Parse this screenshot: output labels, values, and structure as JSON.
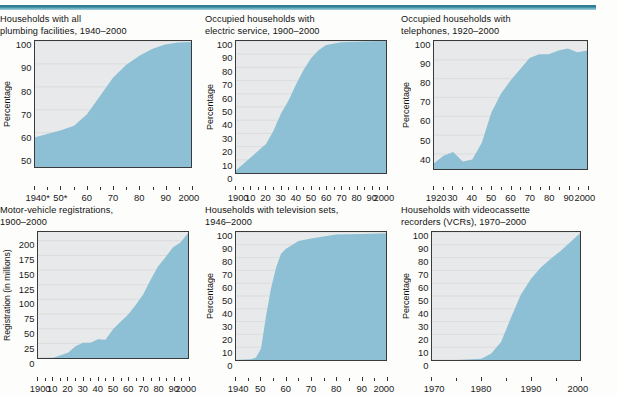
{
  "page": {
    "accent_color": "#2e7f94",
    "area_fill_color": "#8dc0d4",
    "plot_background_color": "#e8e9ea",
    "axis_color": "#3a3a3a"
  },
  "chart_data": [
    {
      "id": "plumbing",
      "type": "area",
      "title": "Households with all\nplumbing facilities, 1940–2000",
      "ylabel": "Percentage",
      "xlabel": "",
      "ylim": [
        45,
        100
      ],
      "yticks": [
        100,
        90,
        80,
        70,
        60,
        50
      ],
      "xlim": [
        1940,
        2000
      ],
      "xtick_values": [
        1940,
        1950,
        1960,
        1970,
        1980,
        1990,
        2000
      ],
      "xtick_labels": [
        "1940*",
        "50*",
        "60",
        "70",
        "80",
        "90",
        "2000"
      ],
      "grid": true,
      "x": [
        1940,
        1945,
        1950,
        1955,
        1960,
        1965,
        1970,
        1975,
        1980,
        1985,
        1990,
        1995,
        2000
      ],
      "values": [
        58,
        59.5,
        61,
        63,
        68,
        76,
        84,
        89.5,
        93.5,
        96.5,
        98.5,
        99.3,
        99.6
      ]
    },
    {
      "id": "electric-service",
      "type": "area",
      "title": "Occupied households with\nelectric service, 1900–2000",
      "ylabel": "Percentage",
      "xlabel": "",
      "ylim": [
        0,
        100
      ],
      "yticks": [
        100,
        90,
        80,
        70,
        60,
        50,
        40,
        30,
        20,
        10,
        0
      ],
      "xlim": [
        1900,
        2000
      ],
      "xtick_values": [
        1900,
        1910,
        1920,
        1930,
        1940,
        1950,
        1960,
        1970,
        1980,
        1990,
        2000
      ],
      "xtick_labels": [
        "1900",
        "10",
        "20",
        "30",
        "40",
        "50",
        "60",
        "70",
        "80",
        "90",
        "2000"
      ],
      "grid": true,
      "x": [
        1900,
        1910,
        1920,
        1925,
        1930,
        1935,
        1940,
        1945,
        1950,
        1955,
        1960,
        1970,
        1980,
        1990,
        2000
      ],
      "values": [
        2,
        12,
        22,
        32,
        45,
        55,
        67,
        78,
        87,
        93,
        97,
        99,
        99.5,
        99.8,
        100
      ]
    },
    {
      "id": "telephones",
      "type": "area",
      "title": "Occupied households with\ntelephones, 1920–2000",
      "ylabel": "Percentage",
      "xlabel": "",
      "ylim": [
        32,
        100
      ],
      "yticks": [
        100,
        90,
        80,
        70,
        60,
        50,
        40
      ],
      "xlim": [
        1920,
        2000
      ],
      "xtick_values": [
        1920,
        1930,
        1940,
        1950,
        1960,
        1970,
        1980,
        1990,
        2000
      ],
      "xtick_labels": [
        "1920",
        "30",
        "40",
        "50",
        "60",
        "70",
        "80",
        "90",
        "2000"
      ],
      "grid": true,
      "x": [
        1920,
        1925,
        1930,
        1935,
        1940,
        1945,
        1950,
        1955,
        1960,
        1965,
        1970,
        1975,
        1980,
        1985,
        1990,
        1995,
        2000
      ],
      "values": [
        35,
        39,
        41,
        36,
        37,
        46,
        62,
        72,
        79,
        85,
        91,
        93,
        93,
        95,
        96,
        94,
        95
      ]
    },
    {
      "id": "motor-vehicle-registrations",
      "type": "area",
      "title": "Motor-vehicle registrations,\n1900–2000",
      "ylabel": "Registration (in millions)",
      "xlabel": "",
      "ylim": [
        0,
        215
      ],
      "yticks": [
        200,
        175,
        150,
        125,
        100,
        75,
        50,
        25,
        0
      ],
      "xlim": [
        1900,
        2000
      ],
      "xtick_values": [
        1900,
        1910,
        1920,
        1930,
        1940,
        1950,
        1960,
        1970,
        1980,
        1990,
        2000
      ],
      "xtick_labels": [
        "1900",
        "10",
        "20",
        "30",
        "40",
        "50",
        "60",
        "70",
        "80",
        "90",
        "2000"
      ],
      "grid": true,
      "x": [
        1900,
        1910,
        1920,
        1925,
        1930,
        1935,
        1940,
        1945,
        1950,
        1955,
        1960,
        1965,
        1970,
        1975,
        1980,
        1985,
        1990,
        1995,
        2000
      ],
      "values": [
        0.1,
        0.5,
        9,
        20,
        26,
        26,
        32,
        31,
        49,
        62,
        74,
        90,
        108,
        133,
        156,
        172,
        189,
        197,
        213
      ]
    },
    {
      "id": "television-sets",
      "type": "area",
      "title": "Households with television sets,\n1946–2000",
      "ylabel": "Percentage",
      "xlabel": "",
      "ylim": [
        0,
        100
      ],
      "yticks": [
        100,
        90,
        80,
        70,
        60,
        50,
        40,
        30,
        20,
        10,
        0
      ],
      "xlim": [
        1940,
        2000
      ],
      "xtick_values": [
        1940,
        1950,
        1960,
        1970,
        1980,
        1990,
        2000
      ],
      "xtick_labels": [
        "1940",
        "50",
        "60",
        "70",
        "80",
        "90",
        "2000"
      ],
      "grid": true,
      "x": [
        1940,
        1946,
        1948,
        1950,
        1952,
        1954,
        1956,
        1958,
        1960,
        1965,
        1970,
        1980,
        1990,
        2000
      ],
      "values": [
        0,
        0.5,
        2,
        9,
        34,
        56,
        72,
        83,
        87,
        93,
        95,
        98,
        98.5,
        99
      ],
      "note": "Values before 1946 are zero; curve rises almost vertically in the 1950s."
    },
    {
      "id": "vcr",
      "type": "area",
      "title": "Households with videocassette\nrecorders (VCRs), 1970–2000",
      "ylabel": "Percentage",
      "xlabel": "",
      "ylim": [
        0,
        100
      ],
      "yticks": [
        100,
        90,
        80,
        70,
        60,
        50,
        40,
        30,
        20,
        10,
        0
      ],
      "xlim": [
        1970,
        2000
      ],
      "xtick_values": [
        1970,
        1980,
        1990,
        2000
      ],
      "xtick_labels": [
        "1970",
        "1980",
        "1990",
        "2000"
      ],
      "grid": true,
      "x": [
        1970,
        1975,
        1980,
        1982,
        1984,
        1986,
        1988,
        1990,
        1992,
        1994,
        1996,
        1998,
        2000
      ],
      "values": [
        0,
        0,
        1,
        5,
        14,
        33,
        51,
        63,
        72,
        79,
        85,
        92,
        99
      ]
    }
  ]
}
